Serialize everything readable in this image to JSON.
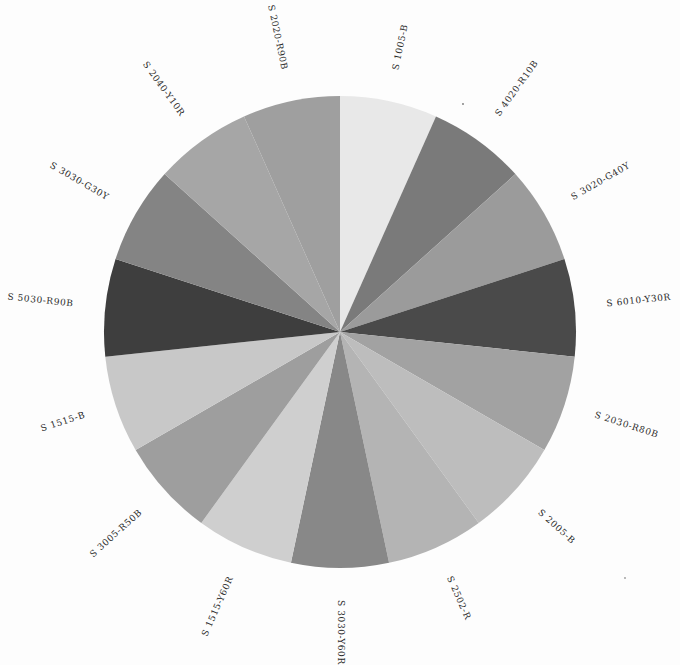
{
  "chart_data": {
    "type": "pie",
    "title": "",
    "start_angle_deg": 0,
    "direction": "clockwise",
    "categories": [
      "S 1005-B",
      "S 4020-R10B",
      "S 3020-G40Y",
      "S 6010-Y30R",
      "S 2030-R80B",
      "S 2005-B",
      "S 2502-R",
      "S 3030-Y60R",
      "S 1515-Y60R",
      "S 3005-R50B",
      "S 1515-B",
      "S 5030-R90B",
      "S 3030-G30Y",
      "S 2040-Y10R",
      "S 2020-R90B"
    ],
    "values": [
      1,
      1,
      1,
      1,
      1,
      1,
      1,
      1,
      1,
      1,
      1,
      1,
      1,
      1,
      1
    ],
    "colors": [
      "#e8e8e8",
      "#7a7a7a",
      "#9b9b9b",
      "#4a4a4a",
      "#a2a2a2",
      "#bdbdbd",
      "#b4b4b4",
      "#888888",
      "#cfcfcf",
      "#9e9e9e",
      "#c8c8c8",
      "#3e3e3e",
      "#848484",
      "#a6a6a6",
      "#9f9f9f"
    ],
    "legend": "labels outside slices, rotated radially"
  },
  "layout": {
    "cx": 340,
    "cy": 332,
    "r": 236,
    "label_r": 268
  }
}
